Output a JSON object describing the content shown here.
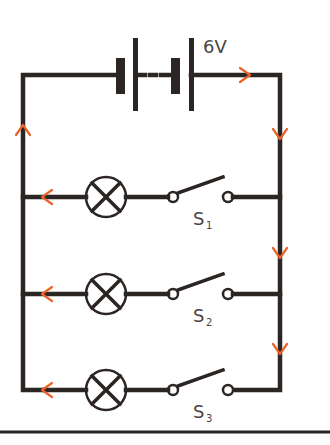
{
  "diagram": {
    "type": "parallel circuit",
    "battery": {
      "label": "6V",
      "cells": 2
    },
    "branches": [
      {
        "lamp": "lamp-1",
        "switch": {
          "label": "S",
          "subscript": "1",
          "state": "open"
        }
      },
      {
        "lamp": "lamp-2",
        "switch": {
          "label": "S",
          "subscript": "2",
          "state": "open"
        }
      },
      {
        "lamp": "lamp-3",
        "switch": {
          "label": "S",
          "subscript": "3",
          "state": "open"
        }
      }
    ],
    "current_direction": "clockwise from battery positive terminal",
    "colors": {
      "wire": "#2b2523",
      "arrow": "#e8622a",
      "text": "#4a4444"
    }
  }
}
